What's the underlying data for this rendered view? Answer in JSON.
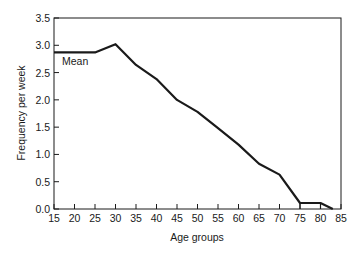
{
  "chart_data": {
    "type": "line",
    "title": "",
    "xlabel": "Age groups",
    "ylabel": "Frequency per week",
    "xlim": [
      15,
      85
    ],
    "ylim": [
      0.0,
      3.5
    ],
    "x_ticks": [
      15,
      20,
      25,
      30,
      35,
      40,
      45,
      50,
      55,
      60,
      65,
      70,
      75,
      80,
      85
    ],
    "y_ticks": [
      "0.0",
      "0.5",
      "1.0",
      "1.5",
      "2.0",
      "2.5",
      "3.0",
      "3.5"
    ],
    "grid": false,
    "legend": null,
    "series": [
      {
        "name": "Frequency per week",
        "x": [
          15,
          25,
          30,
          35,
          40,
          45,
          50,
          55,
          60,
          65,
          70,
          75,
          80,
          83
        ],
        "values": [
          2.87,
          2.87,
          3.02,
          2.64,
          2.38,
          2.0,
          1.78,
          1.48,
          1.18,
          0.83,
          0.63,
          0.11,
          0.11,
          0.0
        ]
      }
    ],
    "annotations": [
      {
        "text": "Mean",
        "x": 17,
        "y": 2.7,
        "note": "labels the flat segment 15–25"
      }
    ],
    "extras": {
      "bracket_75_80": {
        "x_start": 75,
        "x_end": 80,
        "height": 0.11
      }
    },
    "line_color": "#1a1a1a"
  }
}
